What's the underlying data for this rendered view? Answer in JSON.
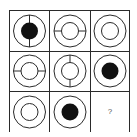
{
  "puzzle": {
    "rows": 3,
    "cols": 3,
    "cells": [
      {
        "row": 0,
        "col": 0,
        "outer_ring": true,
        "inner": "filled-disc",
        "divider": "vertical"
      },
      {
        "row": 0,
        "col": 1,
        "outer_ring": true,
        "inner": "small-ring",
        "divider": "horizontal"
      },
      {
        "row": 0,
        "col": 2,
        "outer_ring": true,
        "inner": "small-ring",
        "divider": "none"
      },
      {
        "row": 1,
        "col": 0,
        "outer_ring": true,
        "inner": "small-ring",
        "divider": "horizontal"
      },
      {
        "row": 1,
        "col": 1,
        "outer_ring": true,
        "inner": "small-ring",
        "divider": "vertical"
      },
      {
        "row": 1,
        "col": 2,
        "outer_ring": true,
        "inner": "filled-disc",
        "divider": "none"
      },
      {
        "row": 2,
        "col": 0,
        "outer_ring": true,
        "inner": "small-ring",
        "divider": "none"
      },
      {
        "row": 2,
        "col": 1,
        "outer_ring": true,
        "inner": "filled-disc",
        "divider": "none"
      },
      {
        "row": 2,
        "col": 2,
        "missing": true
      }
    ],
    "missing_label": "?",
    "colors": {
      "line": "#2a2a2a",
      "fill": "#111111",
      "background": "#ffffff"
    }
  }
}
